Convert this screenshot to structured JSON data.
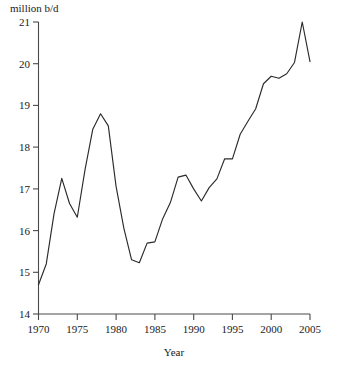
{
  "chart_data": {
    "type": "line",
    "title": "",
    "xlabel": "Year",
    "ylabel": "million b/d",
    "xlim": [
      1970,
      2005
    ],
    "ylim": [
      14,
      21
    ],
    "xticks": [
      1970,
      1975,
      1980,
      1985,
      1990,
      1995,
      2000,
      2005
    ],
    "yticks": [
      14,
      15,
      16,
      17,
      18,
      19,
      20,
      21
    ],
    "grid": false,
    "legend": null,
    "x": [
      1970,
      1971,
      1972,
      1973,
      1974,
      1975,
      1976,
      1977,
      1978,
      1979,
      1980,
      1981,
      1982,
      1983,
      1984,
      1985,
      1986,
      1987,
      1988,
      1989,
      1990,
      1991,
      1992,
      1993,
      1994,
      1995,
      1996,
      1997,
      1998,
      1999,
      2000,
      2001,
      2002,
      2003,
      2004,
      2005
    ],
    "values": [
      14.7,
      15.2,
      16.4,
      17.25,
      16.65,
      16.32,
      17.46,
      18.43,
      18.8,
      18.51,
      17.06,
      16.06,
      15.3,
      15.23,
      15.7,
      15.73,
      16.28,
      16.67,
      17.28,
      17.33,
      17.0,
      16.71,
      17.03,
      17.24,
      17.72,
      17.72,
      18.31,
      18.62,
      18.92,
      19.52,
      19.7,
      19.65,
      19.76,
      20.03,
      21.0,
      20.05
    ],
    "series": [
      {
        "name": "oil consumption",
        "values": [
          14.7,
          15.2,
          16.4,
          17.25,
          16.65,
          16.32,
          17.46,
          18.43,
          18.8,
          18.51,
          17.06,
          16.06,
          15.3,
          15.23,
          15.7,
          15.73,
          16.28,
          16.67,
          17.28,
          17.33,
          17.0,
          16.71,
          17.03,
          17.24,
          17.72,
          17.72,
          18.31,
          18.62,
          18.92,
          19.52,
          19.7,
          19.65,
          19.76,
          20.03,
          21.0,
          20.05
        ]
      }
    ]
  },
  "axes": {
    "y_unit_label": "million b/d",
    "x_axis_title": "Year",
    "y_tick_labels": [
      "14",
      "15",
      "16",
      "17",
      "18",
      "19",
      "20",
      "21"
    ],
    "x_tick_labels": [
      "1970",
      "1975",
      "1980",
      "1985",
      "1990",
      "1995",
      "2000",
      "2005"
    ]
  },
  "colors": {
    "line": "#2b2b2b",
    "axis": "#4a4a4a",
    "text": "#1a1a1a",
    "background": "#ffffff"
  }
}
